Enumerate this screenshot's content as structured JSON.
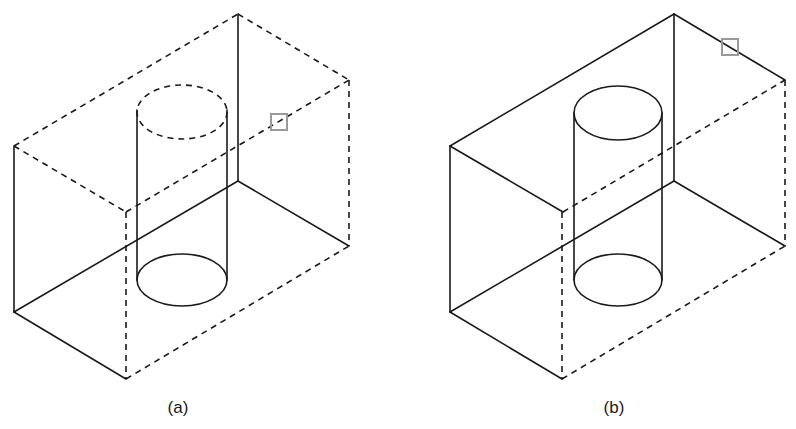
{
  "figures": [
    {
      "id": "a",
      "caption": "(a)",
      "description": "Block with vertical cylindrical hole; top face hidden (dashed), cylinder top dashed",
      "marker": {
        "x": 271,
        "y": 114,
        "size": 16,
        "color": "#999999"
      }
    },
    {
      "id": "b",
      "caption": "(b)",
      "description": "Block with vertical cylindrical hole; top face visible (solid)",
      "marker": {
        "x": 722,
        "y": 39,
        "size": 16,
        "color": "#999999"
      }
    }
  ],
  "colors": {
    "line": "#1a1a1a",
    "marker": "#999999",
    "background": "#ffffff"
  }
}
